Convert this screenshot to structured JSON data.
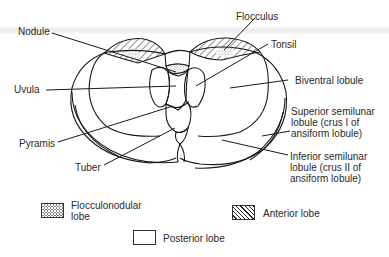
{
  "diagram": {
    "labels": {
      "nodule": "Nodule",
      "flocculus": "Flocculus",
      "tonsil": "Tonsil",
      "uvula": "Uvula",
      "biventral_lobule": "Biventral lobule",
      "superior_semilunar": "Superior semilunar lobule (crus I of ansiform lobule)",
      "pyramis": "Pyramis",
      "inferior_semilunar": "Inferior semilunar lobule (crus II of ansiform lobule)",
      "tuber": "Tuber"
    },
    "legend": [
      {
        "key": "flocculonodular",
        "label": "Flocculonodular lobe",
        "pattern": "stipple"
      },
      {
        "key": "anterior",
        "label": "Anterior lobe",
        "pattern": "diagonal-hatch"
      },
      {
        "key": "posterior",
        "label": "Posterior lobe",
        "pattern": "blank"
      }
    ]
  },
  "colors": {
    "ink": "#1a1a1a",
    "text": "#2a2a2a",
    "background": "#ffffff",
    "stipple": "#9a9a9a"
  }
}
